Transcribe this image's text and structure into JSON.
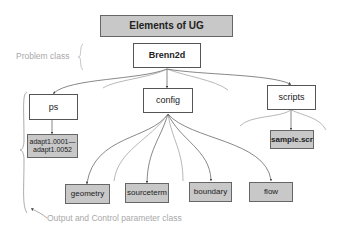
{
  "title": "Elements of UG",
  "annotations": {
    "problem_class": "Problem class",
    "output_control": "Output and Control parameter class"
  },
  "nodes": {
    "root": "Brenn2d",
    "ps": "ps",
    "config": "config",
    "scripts": "scripts",
    "adapt_line1": "adapt1.0001—",
    "adapt_line2": "adapt1.0052",
    "sample": "sample.scr",
    "geometry": "geometry",
    "sourceterm": "sourceterm",
    "boundary": "boundary",
    "flow": "flow"
  },
  "colors": {
    "gray_fill": "#c8c8c8",
    "border": "#555555",
    "annotation": "#a8a8a8"
  }
}
